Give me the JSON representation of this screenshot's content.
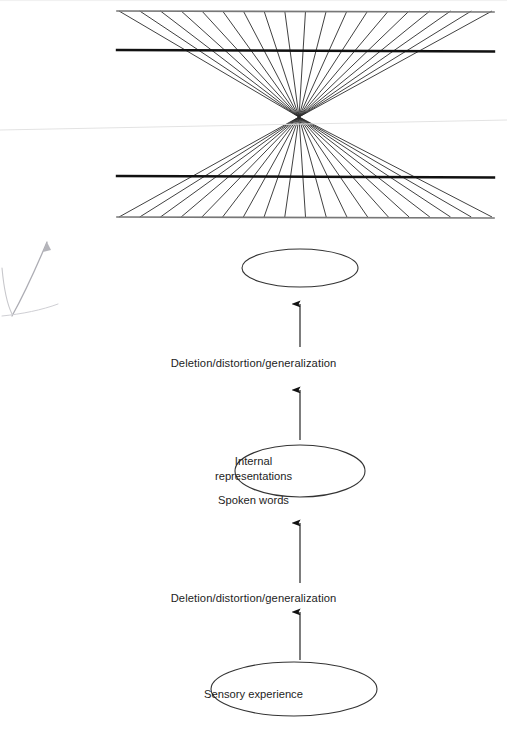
{
  "page": {
    "background_color": "#ffffff",
    "ink_color": "#1d1d1d"
  },
  "illusion_figure": {
    "name": "fan-radiating-lines-illusion",
    "description": "Two sets of lines radiating from a central vanishing point, crossed by four horizontal lines (two bold, two light)",
    "vanishing_point": {
      "x": 299,
      "y": 117
    },
    "bounds": {
      "left": 119,
      "right": 492,
      "top": 11,
      "bottom": 217
    },
    "horizontal_lines": [
      {
        "name": "top-light-rule",
        "y": 11,
        "weight": 1.6,
        "color": "#777777"
      },
      {
        "name": "upper-bold-rule",
        "y": 50,
        "weight": 2.4,
        "color": "#111111"
      },
      {
        "name": "lower-bold-rule",
        "y": 176,
        "weight": 2.4,
        "color": "#111111"
      },
      {
        "name": "bottom-light-rule",
        "y": 217,
        "weight": 1.6,
        "color": "#777777"
      }
    ],
    "ray_count_per_fan": 19,
    "ray_color": "#2b2b2b",
    "ray_weight": 0.9
  },
  "flow_diagram": {
    "name": "nlp-communication-model",
    "orientation": "bottom-to-top",
    "nodes": [
      {
        "id": "spoken-words",
        "label": "Spoken words",
        "shape": "ellipse",
        "cx": 300,
        "cy": 268,
        "rx": 58,
        "ry": 19,
        "lines": [
          "Spoken words"
        ]
      },
      {
        "id": "internal-representations",
        "label": "Internal representations",
        "shape": "ellipse",
        "cx": 300,
        "cy": 471,
        "rx": 65,
        "ry": 26,
        "lines": [
          "Internal",
          "representations"
        ]
      },
      {
        "id": "sensory-experience",
        "label": "Sensory experience",
        "shape": "ellipse",
        "cx": 294,
        "cy": 689,
        "rx": 83,
        "ry": 27,
        "lines": [
          "Sensory experience"
        ]
      }
    ],
    "edges": [
      {
        "id": "edge-internal-to-spoken",
        "from": "internal-representations",
        "to": "spoken-words",
        "label": "Deletion/distortion/generalization",
        "arrow_upper": {
          "x": 300,
          "y1": 347,
          "y2": 304
        },
        "arrow_lower": {
          "x": 300,
          "y1": 440,
          "y2": 390
        }
      },
      {
        "id": "edge-sensory-to-internal",
        "from": "sensory-experience",
        "to": "internal-representations",
        "label": "Deletion/distortion/generalization",
        "arrow_upper": {
          "x": 300,
          "y1": 583,
          "y2": 523
        },
        "arrow_lower": {
          "x": 300,
          "y1": 660,
          "y2": 612
        }
      }
    ],
    "edge_labels": [
      {
        "id": "edge-label-upper",
        "text": "Deletion/distortion/generalization",
        "cx": 295,
        "cy": 365
      },
      {
        "id": "edge-label-lower",
        "text": "Deletion/distortion/generalization",
        "cx": 295,
        "cy": 600
      }
    ]
  }
}
